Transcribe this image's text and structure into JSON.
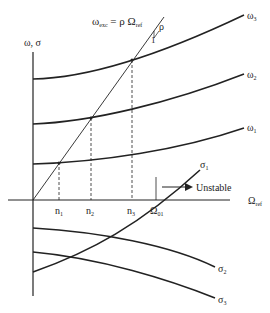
{
  "diagram": {
    "y_axis_label": "ω, σ",
    "x_axis_label_main": "Ω",
    "x_axis_label_sub": "ref",
    "excitation_label_main": "ω",
    "excitation_label_sub": "exc",
    "excitation_label_rest": " = ρ Ω",
    "excitation_label_sub2": "ref",
    "slope_rho": "ρ",
    "slope_one": "1",
    "unstable_label": "Unstable",
    "omega_labels": [
      {
        "main": "ω",
        "sub": "3"
      },
      {
        "main": "ω",
        "sub": "2"
      },
      {
        "main": "ω",
        "sub": "1"
      }
    ],
    "sigma_labels": [
      {
        "main": "σ",
        "sub": "1"
      },
      {
        "main": "σ",
        "sub": "2"
      },
      {
        "main": "σ",
        "sub": "3"
      }
    ],
    "tick_labels": [
      {
        "main": "n",
        "sub": "1"
      },
      {
        "main": "n",
        "sub": "2"
      },
      {
        "main": "n",
        "sub": "3"
      },
      {
        "main": "Ω",
        "sub": "01"
      }
    ],
    "colors": {
      "line": "#222222",
      "background": "#ffffff"
    }
  }
}
